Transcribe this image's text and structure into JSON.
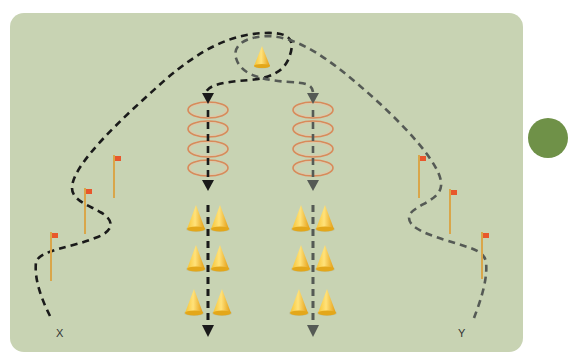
{
  "diagram": {
    "type": "training drill field diagram",
    "background_color": "#c8d3b3",
    "labels": {
      "start_left": "X",
      "start_right": "Y"
    },
    "colors": {
      "path_left": "#1a1a1a",
      "path_right": "#555a55",
      "cone": "#f2b81c",
      "ring": "#d98a5a",
      "pole": "#d9a64a",
      "flag": "#e8572c",
      "badge": "#6f9148"
    },
    "elements": {
      "top_cone": {
        "x": 262,
        "y": 57
      },
      "ring_columns": [
        {
          "name": "left-ring-ladder",
          "x": 208,
          "rings_y": [
            110,
            129,
            149,
            168
          ]
        },
        {
          "name": "right-ring-ladder",
          "x": 313,
          "rings_y": [
            110,
            129,
            149,
            168
          ]
        }
      ],
      "cone_columns": [
        {
          "name": "left-cone-pairs",
          "x": 208,
          "rows_y": [
            228,
            268,
            312
          ]
        },
        {
          "name": "right-cone-pairs",
          "x": 313,
          "rows_y": [
            228,
            268,
            312
          ]
        }
      ],
      "poles_left": [
        {
          "x": 51,
          "top": 232,
          "bottom": 281
        },
        {
          "x": 85,
          "top": 188,
          "bottom": 234
        },
        {
          "x": 114,
          "top": 155,
          "bottom": 198
        }
      ],
      "poles_right": [
        {
          "x": 419,
          "top": 155,
          "bottom": 198
        },
        {
          "x": 450,
          "top": 189,
          "bottom": 234
        },
        {
          "x": 482,
          "top": 232,
          "bottom": 279
        }
      ]
    },
    "label_positions": {
      "x": {
        "x": 60,
        "y": 334
      },
      "y": {
        "x": 462,
        "y": 334
      }
    }
  }
}
